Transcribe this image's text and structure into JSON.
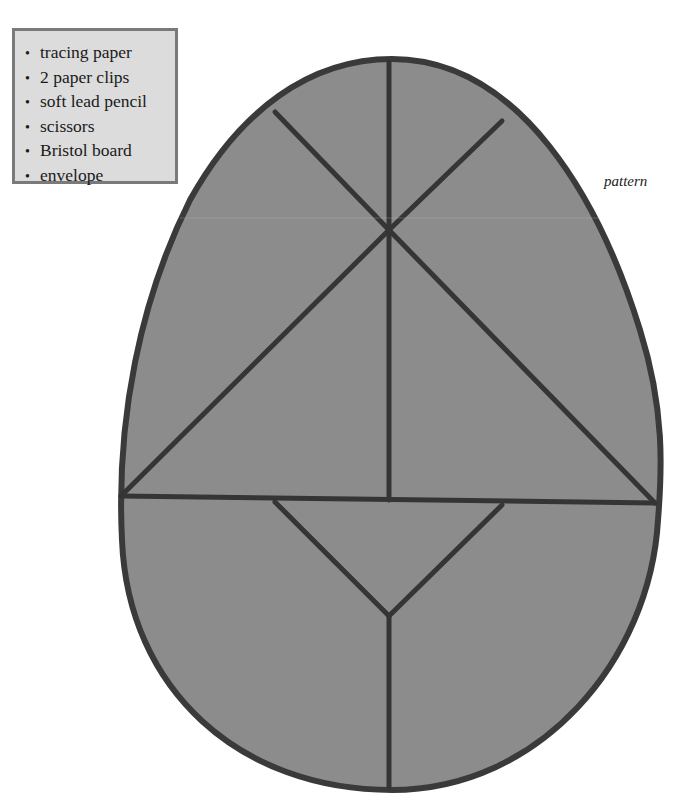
{
  "materials": {
    "items": [
      {
        "label": "tracing paper"
      },
      {
        "label": "2 paper clips"
      },
      {
        "label": "soft lead pencil"
      },
      {
        "label": "scissors"
      },
      {
        "label": "Bristol board"
      },
      {
        "label": "envelope"
      }
    ],
    "bullet": "•"
  },
  "caption": "pattern",
  "colors": {
    "egg_fill": "#8c8c8c",
    "outline": "#3a3a3a",
    "box_fill": "#dcdcdc",
    "box_border": "#7a7a7a"
  }
}
